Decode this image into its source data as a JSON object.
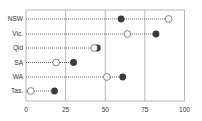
{
  "chart_data": {
    "type": "dot",
    "title": "",
    "xlabel": "",
    "ylabel": "",
    "xlim": [
      0,
      100
    ],
    "x_ticks": [
      "0",
      "25",
      "50",
      "75",
      "100"
    ],
    "categories": [
      "NSW",
      "Vic.",
      "Qld",
      "SA",
      "WA",
      "Tas."
    ],
    "series": [
      {
        "name": "open",
        "marker": "open-circle",
        "values": [
          90,
          64,
          43,
          19,
          51,
          3
        ]
      },
      {
        "name": "filled",
        "marker": "filled-circle",
        "values": [
          60,
          82,
          45,
          30,
          61,
          18
        ]
      }
    ],
    "grid": {
      "vertical": true,
      "horizontal": false
    },
    "legend": null,
    "colors": {
      "filled": "#3a3a3a",
      "open_stroke": "#555555",
      "grid": "#999999",
      "connector": "#555555"
    }
  }
}
